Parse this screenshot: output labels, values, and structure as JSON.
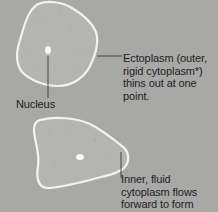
{
  "diagram": {
    "labels": {
      "ectoplasm": "Ectoplasm (outer, rigid cytoplasm*) thins out at one point.",
      "nucleus": "Nucleus",
      "inner_cytoplasm": "Inner, fluid cytoplasm flows forward to form"
    },
    "colors": {
      "background": "#a8a8a6",
      "cell_fill": "#b4b4b2",
      "cell_outline": "#f2f2f0",
      "nucleus": "#f8f8f6",
      "leader_line": "#2a2a2a",
      "text": "#1e1e1e"
    }
  }
}
